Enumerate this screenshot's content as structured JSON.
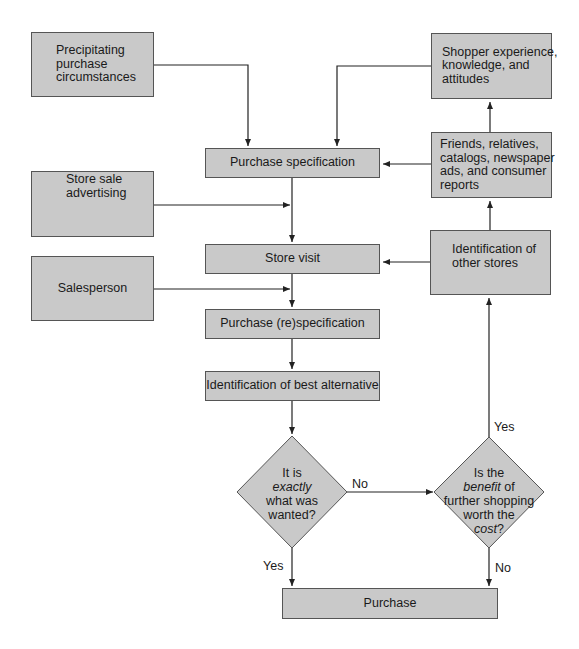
{
  "colors": {
    "box_fill": "#c9c9c9",
    "border": "#555555",
    "line": "#222222"
  },
  "nodes": {
    "precipitating": {
      "lines": [
        "Precipitating",
        "purchase",
        "circumstances"
      ]
    },
    "shopper_experience": {
      "lines": [
        "Shopper experience,",
        "knowledge, and",
        "attitudes"
      ]
    },
    "purchase_specification": {
      "label": "Purchase specification"
    },
    "friends": {
      "lines": [
        "Friends, relatives,",
        "catalogs, newspaper",
        "ads, and consumer",
        "reports"
      ]
    },
    "store_sale_advertising": {
      "lines": [
        "Store sale",
        "advertising"
      ]
    },
    "store_visit": {
      "label": "Store visit"
    },
    "other_stores": {
      "lines": [
        "Identification of",
        "other stores"
      ]
    },
    "salesperson": {
      "label": "Salesperson"
    },
    "respecification": {
      "label": "Purchase (re)specification"
    },
    "best_alternative": {
      "label": "Identification of best alternative"
    },
    "decision_exact": {
      "l1": "It is",
      "l2_em": "exactly",
      "l3": "what was",
      "l4": "wanted?"
    },
    "decision_benefit": {
      "l1": "Is the",
      "l2_em": "benefit",
      "l2_rest": " of",
      "l3": "further shopping",
      "l4": "worth the",
      "l5_em": "cost",
      "l5_rest": "?"
    },
    "purchase": {
      "label": "Purchase"
    }
  },
  "edge_labels": {
    "exact_no": "No",
    "exact_yes": "Yes",
    "benefit_yes": "Yes",
    "benefit_no": "No"
  }
}
